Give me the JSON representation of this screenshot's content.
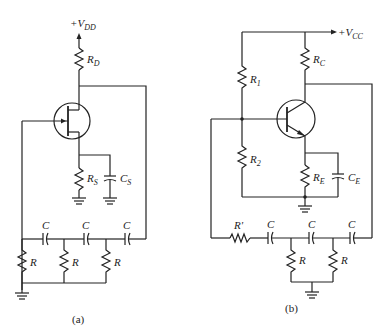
{
  "figure": {
    "panels": [
      {
        "id": "a",
        "caption": "(a)",
        "supply": {
          "sign": "+V",
          "sub": "DD"
        },
        "transistor": "n-channel JFET",
        "components": {
          "RD": {
            "main": "R",
            "sub": "D"
          },
          "RS": {
            "main": "R",
            "sub": "S"
          },
          "CS": {
            "main": "C",
            "sub": "S"
          },
          "C1": "C",
          "C2": "C",
          "C3": "C",
          "R1": "R",
          "R2": "R",
          "R3": "R"
        }
      },
      {
        "id": "b",
        "caption": "(b)",
        "supply": {
          "sign": "+V",
          "sub": "CC"
        },
        "transistor": "NPN BJT",
        "components": {
          "RC": {
            "main": "R",
            "sub": "C"
          },
          "R1": {
            "main": "R",
            "sub": "1"
          },
          "R2": {
            "main": "R",
            "sub": "2"
          },
          "RE": {
            "main": "R",
            "sub": "E"
          },
          "CE": {
            "main": "C",
            "sub": "E"
          },
          "Rp": "R'",
          "C1": "C",
          "C2": "C",
          "C3": "C",
          "R4": "R",
          "R5": "R"
        }
      }
    ]
  }
}
